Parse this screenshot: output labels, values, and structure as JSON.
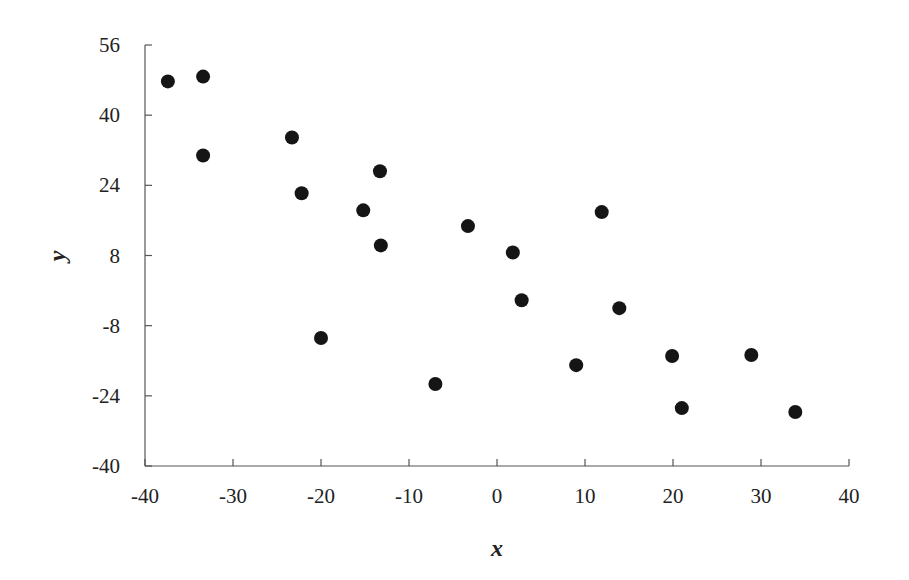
{
  "chart_data": {
    "type": "scatter",
    "title": "",
    "xlabel": "x",
    "ylabel": "y",
    "xlim": [
      -40,
      40
    ],
    "ylim": [
      -40,
      56
    ],
    "x_ticks": [
      -40,
      -30,
      -20,
      -10,
      0,
      10,
      20,
      30,
      40
    ],
    "y_ticks": [
      -40,
      -24,
      -8,
      8,
      24,
      40,
      56
    ],
    "grid": false,
    "legend": null,
    "marker_color": "#151515",
    "points": [
      {
        "x": -37.4,
        "y": 47.7
      },
      {
        "x": -33.4,
        "y": 48.8
      },
      {
        "x": -33.4,
        "y": 30.8
      },
      {
        "x": -23.3,
        "y": 34.9
      },
      {
        "x": -22.2,
        "y": 22.2
      },
      {
        "x": -20.0,
        "y": -10.8
      },
      {
        "x": -15.2,
        "y": 18.3
      },
      {
        "x": -13.3,
        "y": 27.2
      },
      {
        "x": -13.2,
        "y": 10.3
      },
      {
        "x": -7.0,
        "y": -21.3
      },
      {
        "x": -3.3,
        "y": 14.7
      },
      {
        "x": 1.8,
        "y": 8.7
      },
      {
        "x": 2.8,
        "y": -2.2
      },
      {
        "x": 9.0,
        "y": -17.0
      },
      {
        "x": 11.9,
        "y": 17.9
      },
      {
        "x": 13.9,
        "y": -4.0
      },
      {
        "x": 19.9,
        "y": -14.9
      },
      {
        "x": 21.0,
        "y": -26.8
      },
      {
        "x": 28.9,
        "y": -14.7
      },
      {
        "x": 33.9,
        "y": -27.7
      }
    ]
  }
}
